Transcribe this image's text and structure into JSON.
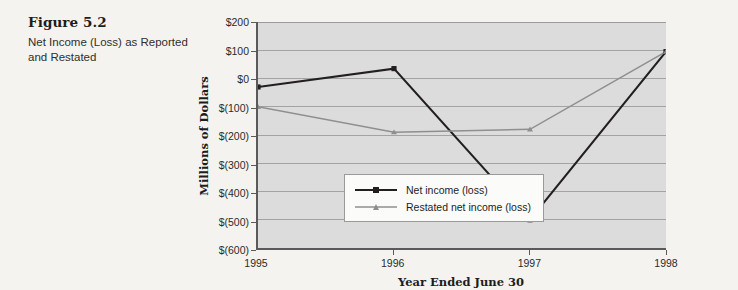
{
  "figure": {
    "number": "Figure 5.2",
    "caption": "Net Income (Loss) as Reported and Restated"
  },
  "chart_data": {
    "type": "line",
    "title": "",
    "xlabel": "Year Ended June 30",
    "ylabel": "Millions of Dollars",
    "categories": [
      "1995",
      "1996",
      "1997",
      "1998"
    ],
    "x": [
      1995,
      1996,
      1997,
      1998
    ],
    "series": [
      {
        "name": "Net income (loss)",
        "values": [
          -30,
          35,
          -500,
          95
        ],
        "color": "#231f20",
        "marker": "square"
      },
      {
        "name": "Restated net income (loss)",
        "values": [
          -100,
          -190,
          -180,
          95
        ],
        "color": "#8f8f8f",
        "marker": "triangle"
      }
    ],
    "ylim": [
      -600,
      200
    ],
    "yticks": [
      200,
      100,
      0,
      -100,
      -200,
      -300,
      -400,
      -500,
      -600
    ],
    "ytick_labels": [
      "$200",
      "$100",
      "$0",
      "$(100)",
      "$(200)",
      "$(300)",
      "$(400)",
      "$(500)",
      "$(600)"
    ],
    "grid": "horizontal",
    "legend_position": "inside-lower-left",
    "plot_background": "#dddcdc",
    "page_background": "#f4f3ef"
  }
}
